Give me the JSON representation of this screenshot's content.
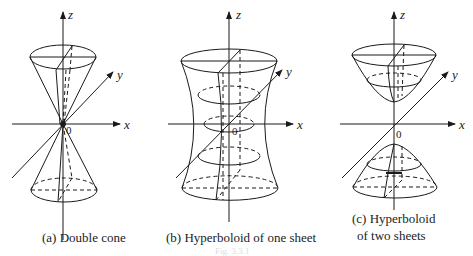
{
  "figure": {
    "panels": [
      {
        "id": "a",
        "caption": "(a)  Double cone",
        "axes": {
          "z": "z",
          "y": "y",
          "x": "x",
          "origin": "0"
        }
      },
      {
        "id": "b",
        "caption": "(b)  Hyperboloid of one sheet",
        "axes": {
          "z": "z",
          "y": "y",
          "x": "x",
          "origin": "0"
        }
      },
      {
        "id": "c",
        "caption_line1": "(c)  Hyperboloid",
        "caption_line2": "of two sheets",
        "axes": {
          "z": "z",
          "y": "y",
          "x": "x",
          "origin": "0"
        }
      }
    ],
    "footer_label": "Fig. 3.3.1"
  },
  "colors": {
    "stroke": "#1a1a1a",
    "background": "#ffffff"
  }
}
